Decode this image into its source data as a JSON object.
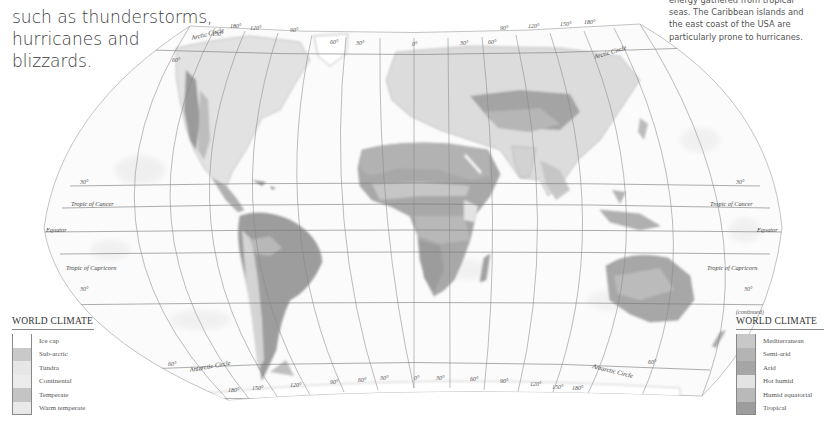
{
  "intro_text": {
    "lines": [
      "such as thunderstorms,",
      "hurricanes and",
      "blizzards."
    ]
  },
  "side_text": {
    "lines": [
      "energy gathered from tropical",
      "seas. The Caribbean islands and",
      "the east coast of the USA are",
      "particularly prone to hurricanes."
    ]
  },
  "map": {
    "labels": {
      "arctic_circle_left": "Arctic Circle",
      "arctic_circle_right": "Arctic Circle",
      "tropic_of_cancer_left": "Tropic of Cancer",
      "tropic_of_cancer_right": "Tropic of Cancer",
      "equator_left": "Equator",
      "equator_right": "Equator",
      "tropic_of_capricorn_left": "Tropic of Capricorn",
      "tropic_of_capricorn_right": "Tropic of Capricorn",
      "antarctic_circle_left": "Antarctic Circle",
      "antarctic_circle_right": "Antarctic Circle",
      "lat_30n_left": "30°",
      "lat_30n_right": "30°",
      "lat_30s_left": "30°",
      "lat_30s_right": "30°",
      "lat_60n_left": "60°",
      "lat_60s_left": "60°",
      "lat_60s_right": "60°"
    },
    "top_longitudes": [
      "180°",
      "150°",
      "120°",
      "90°",
      "60°",
      "30°",
      "0°",
      "30°",
      "60°",
      "90°",
      "120°",
      "150°",
      "180°"
    ],
    "bottom_longitudes": [
      "180°",
      "150°",
      "120°",
      "90°",
      "60°",
      "30°",
      "0°",
      "30°",
      "60°",
      "90°",
      "120°",
      "150°",
      "180°"
    ]
  },
  "legend_left": {
    "title": "WORLD CLIMATE",
    "items": [
      {
        "label": "Ice cap",
        "color": "#ffffff"
      },
      {
        "label": "Sub-arctic",
        "color": "#c9c9c9"
      },
      {
        "label": "Tundra",
        "color": "#e6e6e6"
      },
      {
        "label": "Continental",
        "color": "#ececec"
      },
      {
        "label": "Temperate",
        "color": "#c4c4c4"
      },
      {
        "label": "Warm temperate",
        "color": "#e9e9e9"
      }
    ]
  },
  "legend_right": {
    "continued": "(continued)",
    "title": "WORLD CLIMATE",
    "items": [
      {
        "label": "Mediterranean",
        "color": "#c8c8c8"
      },
      {
        "label": "Semi-arid",
        "color": "#b4b4b4"
      },
      {
        "label": "Arid",
        "color": "#a6a6a6"
      },
      {
        "label": "Hot humid",
        "color": "#e3e3e3"
      },
      {
        "label": "Humid equatorial",
        "color": "#b9b9b9"
      },
      {
        "label": "Tropical",
        "color": "#9d9d9d"
      }
    ]
  }
}
